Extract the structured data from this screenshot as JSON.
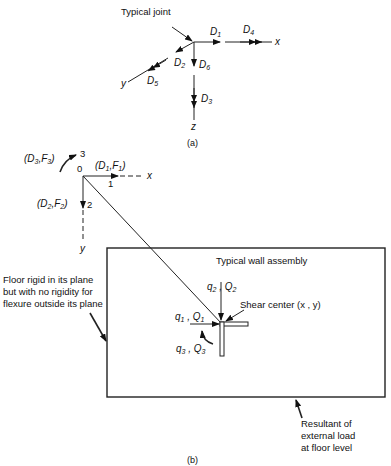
{
  "part_a": {
    "callout": "Typical joint",
    "axes": {
      "x": "x",
      "y": "y",
      "z": "z"
    },
    "dofs": {
      "D1": {
        "main": "D",
        "sub": "1"
      },
      "D2": {
        "main": "D",
        "sub": "2"
      },
      "D3": {
        "main": "D",
        "sub": "3"
      },
      "D4": {
        "main": "D",
        "sub": "4"
      },
      "D5": {
        "main": "D",
        "sub": "5"
      },
      "D6": {
        "main": "D",
        "sub": "6"
      }
    },
    "caption": "(a)"
  },
  "part_b": {
    "origin_label": "0",
    "axis_x": "x",
    "axis_y": "y",
    "dir1": {
      "num": "1",
      "label": "(D",
      "s1": "1",
      "mid": ",F",
      "s2": "1",
      "end": ")"
    },
    "dir2": {
      "num": "2",
      "label": "(D",
      "s1": "2",
      "mid": ",F",
      "s2": "2",
      "end": ")"
    },
    "dir3": {
      "num": "3",
      "label": "(D",
      "s1": "3",
      "mid": ",F",
      "s2": "3",
      "end": ")"
    },
    "wall_title": "Typical wall assembly",
    "shear_center": "Shear center (x , y)",
    "q1": {
      "a": "q",
      "as": "1",
      "b": " , Q",
      "bs": "1"
    },
    "q2": {
      "a": "q",
      "as": "2",
      "b": " , Q",
      "bs": "2"
    },
    "q3": {
      "a": "q",
      "as": "3",
      "b": " , Q",
      "bs": "3"
    },
    "floor_note": [
      "Floor rigid in its plane",
      "but with no rigidity for",
      "flexure outside its plane"
    ],
    "resultant_note": [
      "Resultant of",
      "external load",
      "at floor level"
    ],
    "caption": "(b)"
  }
}
